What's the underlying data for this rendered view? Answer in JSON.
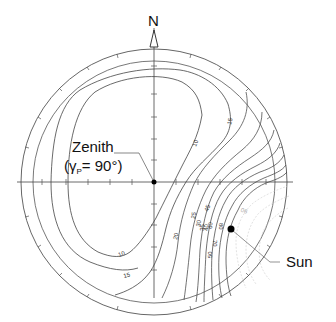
{
  "diagram": {
    "type": "polar sky-map contour plot (degree of polarization)",
    "north_label": "N",
    "zenith": {
      "label": "Zenith",
      "sublabel": "(γP= 90°)",
      "sublabel_parts": {
        "gamma": "γ",
        "subscript": "P",
        "rest": "= 90°)",
        "open": "("
      }
    },
    "sun": {
      "label": "Sun"
    },
    "contour_labels": {
      "upper": [
        "10",
        "15"
      ],
      "lower": [
        "10",
        "15"
      ],
      "inner": [
        "20",
        "25",
        "30",
        "35",
        "40",
        "45",
        "50",
        "60",
        "70",
        "80",
        "90"
      ]
    },
    "colors": {
      "line": "#333333",
      "circle": "#555555",
      "faint": "#c8c8c8",
      "dot": "#000000"
    }
  }
}
